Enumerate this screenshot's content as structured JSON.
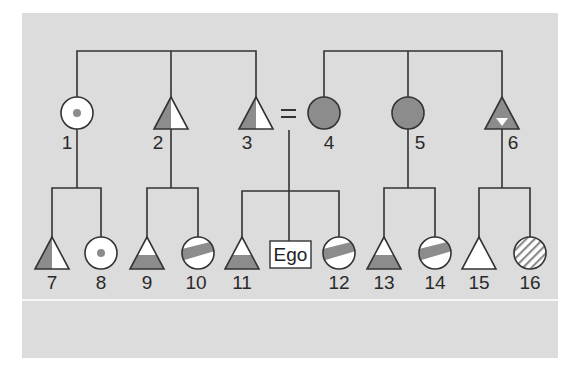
{
  "diagram": {
    "colors": {
      "background": "#dcdcdc",
      "shade": "#8c8c8c",
      "line": "#333333",
      "white": "#ffffff"
    },
    "generation1": [
      {
        "id": "1",
        "label": "1",
        "sex": "female",
        "fill": "dot"
      },
      {
        "id": "2",
        "label": "2",
        "sex": "male",
        "fill": "left-half"
      },
      {
        "id": "3",
        "label": "3",
        "sex": "male",
        "fill": "left-half"
      },
      {
        "id": "4",
        "label": "4",
        "sex": "female",
        "fill": "solid"
      },
      {
        "id": "5",
        "label": "5",
        "sex": "female",
        "fill": "solid"
      },
      {
        "id": "6",
        "label": "6",
        "sex": "male",
        "fill": "solid-inverted-triangle"
      }
    ],
    "marriage_symbol": "=",
    "generation2": [
      {
        "id": "7",
        "label": "7",
        "sex": "male",
        "fill": "left-half"
      },
      {
        "id": "8",
        "label": "8",
        "sex": "female",
        "fill": "dot"
      },
      {
        "id": "9",
        "label": "9",
        "sex": "male",
        "fill": "bottom-band"
      },
      {
        "id": "10",
        "label": "10",
        "sex": "female",
        "fill": "diagonal-band"
      },
      {
        "id": "11",
        "label": "11",
        "sex": "male",
        "fill": "bottom-band"
      },
      {
        "id": "ego",
        "label": "Ego",
        "sex": "ego",
        "fill": "none"
      },
      {
        "id": "12",
        "label": "12",
        "sex": "female",
        "fill": "diagonal-band"
      },
      {
        "id": "13",
        "label": "13",
        "sex": "male",
        "fill": "bottom-band"
      },
      {
        "id": "14",
        "label": "14",
        "sex": "female",
        "fill": "diagonal-band"
      },
      {
        "id": "15",
        "label": "15",
        "sex": "male",
        "fill": "none"
      },
      {
        "id": "16",
        "label": "16",
        "sex": "female",
        "fill": "hatched"
      }
    ]
  }
}
